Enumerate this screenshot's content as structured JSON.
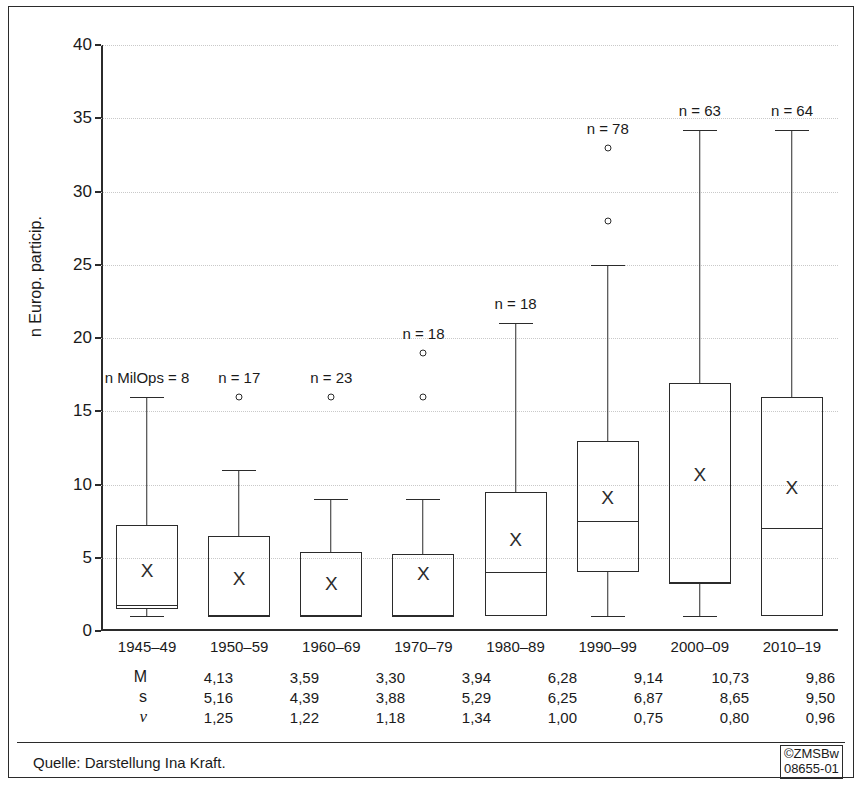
{
  "figure": {
    "source_note": "Quelle: Darstellung Ina Kraft.",
    "credit_line1": "©ZMSBw",
    "credit_line2": "08655-01"
  },
  "chart_data": {
    "type": "box",
    "title": "",
    "xlabel": "",
    "ylabel": "n Europ. particip.",
    "ylim": [
      0,
      40
    ],
    "yticks": [
      0,
      5,
      10,
      15,
      20,
      25,
      30,
      35,
      40
    ],
    "grid": true,
    "legend": "none",
    "categories": [
      "1945–49",
      "1950–59",
      "1960–69",
      "1970–79",
      "1980–89",
      "1990–99",
      "2000–09",
      "2010–19"
    ],
    "n_labels": [
      "n MilOps = 8",
      "n = 17",
      "n = 23",
      "n = 18",
      "n = 18",
      "n = 78",
      "n = 63",
      "n = 64"
    ],
    "n_values": [
      8,
      17,
      23,
      18,
      18,
      78,
      63,
      64
    ],
    "boxes": [
      {
        "category": "1945–49",
        "whisker_low": 1.0,
        "q1": 1.5,
        "median": 1.8,
        "q3": 7.25,
        "whisker_high": 16.0,
        "mean": 4.13,
        "outliers": []
      },
      {
        "category": "1950–59",
        "whisker_low": 1.0,
        "q1": 1.0,
        "median": 1.0,
        "q3": 6.5,
        "whisker_high": 11.0,
        "mean": 3.59,
        "outliers": [
          16.0
        ]
      },
      {
        "category": "1960–69",
        "whisker_low": 1.0,
        "q1": 1.0,
        "median": 1.0,
        "q3": 5.4,
        "whisker_high": 9.0,
        "mean": 3.3,
        "outliers": [
          16.0
        ]
      },
      {
        "category": "1970–79",
        "whisker_low": 1.0,
        "q1": 1.0,
        "median": 1.0,
        "q3": 5.25,
        "whisker_high": 9.0,
        "mean": 3.94,
        "outliers": [
          19.0,
          16.0
        ]
      },
      {
        "category": "1980–89",
        "whisker_low": 1.0,
        "q1": 1.0,
        "median": 4.0,
        "q3": 9.5,
        "whisker_high": 21.0,
        "mean": 6.28,
        "outliers": []
      },
      {
        "category": "1990–99",
        "whisker_low": 1.0,
        "q1": 4.0,
        "median": 7.5,
        "q3": 13.0,
        "whisker_high": 25.0,
        "mean": 9.14,
        "outliers": [
          33.0,
          28.0
        ]
      },
      {
        "category": "2000–09",
        "whisker_low": 1.0,
        "q1": 3.3,
        "median": 3.3,
        "q3": 16.9,
        "whisker_high": 34.2,
        "mean": 10.73,
        "outliers": []
      },
      {
        "category": "2010–19",
        "whisker_low": 1.0,
        "q1": 1.0,
        "median": 7.0,
        "q3": 16.0,
        "whisker_high": 34.2,
        "mean": 9.86,
        "outliers": []
      }
    ],
    "stats_table": {
      "rows": [
        {
          "label": "M",
          "values": [
            "4,13",
            "3,59",
            "3,30",
            "3,94",
            "6,28",
            "9,14",
            "10,73",
            "9,86"
          ]
        },
        {
          "label": "s",
          "values": [
            "5,16",
            "4,39",
            "3,88",
            "5,29",
            "6,25",
            "6,87",
            "8,65",
            "9,50"
          ]
        },
        {
          "label": "ν",
          "values": [
            "1,25",
            "1,22",
            "1,18",
            "1,34",
            "1,00",
            "0,75",
            "0,80",
            "0,96"
          ]
        }
      ]
    },
    "mean_marker_glyph": "X"
  }
}
